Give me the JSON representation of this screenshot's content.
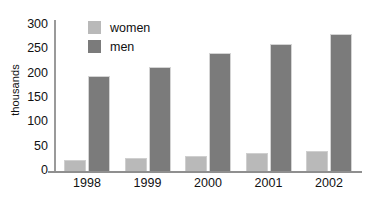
{
  "chart_data": {
    "type": "bar",
    "title": "",
    "xlabel": "",
    "ylabel": "thousands",
    "categories": [
      "1998",
      "1999",
      "2000",
      "2001",
      "2002"
    ],
    "series": [
      {
        "name": "women",
        "color": "#b9b9b9",
        "values": [
          23,
          27,
          31,
          36,
          41
        ]
      },
      {
        "name": "men",
        "color": "#7b7b7b",
        "values": [
          196,
          214,
          242,
          261,
          281
        ]
      }
    ],
    "ylim": [
      0,
      300
    ],
    "ytick_values": [
      0,
      50,
      100,
      150,
      200,
      250,
      300
    ],
    "ytick_labels": [
      "0",
      "50",
      "100",
      "150",
      "200",
      "250",
      "300"
    ],
    "grid": false,
    "legend_position": "top-left-inside"
  },
  "legend": {
    "items": [
      {
        "label": "women",
        "color": "#b9b9b9"
      },
      {
        "label": "men",
        "color": "#7b7b7b"
      }
    ]
  },
  "axes": {
    "y_title": "thousands",
    "axis_color": "#8f8f8f"
  }
}
